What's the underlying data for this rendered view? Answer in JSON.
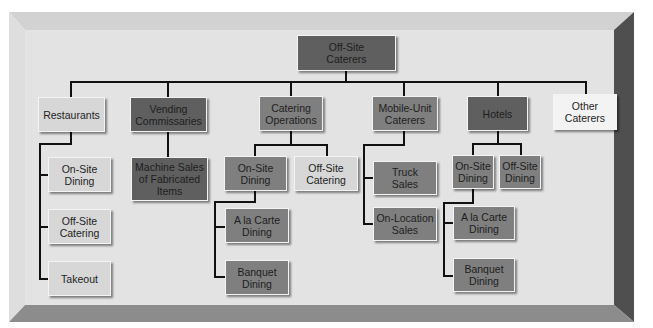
{
  "diagram": {
    "type": "organizational-chart",
    "root": {
      "id": "root",
      "label": "Off-Site\nCaterers"
    },
    "categories": [
      {
        "id": "restaurants",
        "label": "Restaurants",
        "children": [
          {
            "id": "rest-onsite",
            "label": "On-Site\nDining"
          },
          {
            "id": "rest-offsite",
            "label": "Off-Site\nCatering"
          },
          {
            "id": "rest-takeout",
            "label": "Takeout"
          }
        ]
      },
      {
        "id": "vending",
        "label": "Vending\nCommissaries",
        "children": [
          {
            "id": "vend-machine",
            "label": "Machine Sales\nof Fabricated\nItems"
          }
        ]
      },
      {
        "id": "catering-ops",
        "label": "Catering\nOperations",
        "children": [
          {
            "id": "cat-onsite",
            "label": "On-Site\nDining",
            "children": [
              {
                "id": "cat-alacarte",
                "label": "A la Carte\nDining"
              },
              {
                "id": "cat-banquet",
                "label": "Banquet\nDining"
              }
            ]
          },
          {
            "id": "cat-offsite",
            "label": "Off-Site\nCatering"
          }
        ]
      },
      {
        "id": "mobile",
        "label": "Mobile-Unit\nCaterers",
        "children": [
          {
            "id": "mob-truck",
            "label": "Truck\nSales"
          },
          {
            "id": "mob-onloc",
            "label": "On-Location\nSales"
          }
        ]
      },
      {
        "id": "hotels",
        "label": "Hotels",
        "children": [
          {
            "id": "hot-onsite",
            "label": "On-Site\nDining",
            "children": [
              {
                "id": "hot-alacarte",
                "label": "A la Carte\nDining"
              },
              {
                "id": "hot-banquet",
                "label": "Banquet\nDining"
              }
            ]
          },
          {
            "id": "hot-offsite",
            "label": "Off-Site\nDining"
          }
        ]
      },
      {
        "id": "other",
        "label": "Other\nCaterers",
        "children": []
      }
    ]
  },
  "colors": {
    "frame_face": "#e1e1e1",
    "frame_top_bevel": "#d2d2d2",
    "frame_left_bevel": "#dcdcdc",
    "frame_right_bevel": "#4f4f4f",
    "frame_bottom_bevel": "#8a8a8a",
    "connector": "#111111"
  }
}
